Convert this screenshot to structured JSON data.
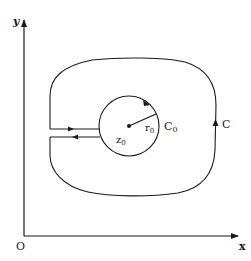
{
  "diagram": {
    "type": "complex-plane contour diagram",
    "axes": {
      "x_label": "x",
      "y_label": "y",
      "origin_label": "O"
    },
    "outer_contour": {
      "label": "C",
      "orientation": "counterclockwise"
    },
    "inner_circle": {
      "label": "C",
      "label_sub": "0",
      "orientation": "clockwise"
    },
    "center_point": {
      "label": "z",
      "label_sub": "0"
    },
    "radius": {
      "label": "r",
      "label_sub": "0"
    },
    "colors": {
      "stroke": "#1a1a1a",
      "background": "#ffffff"
    }
  }
}
